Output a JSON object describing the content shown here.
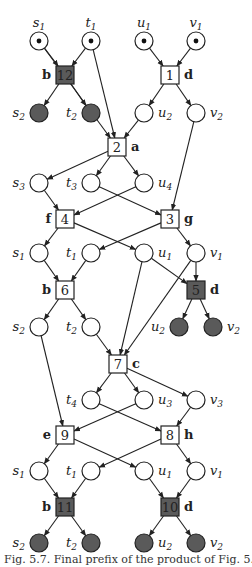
{
  "figure": {
    "caption": "Fig. 5.7. Final prefix of the product of Fig. 5.5",
    "colors": {
      "filled": "#5a5a5a",
      "stroke": "#222222",
      "empty": "#ffffff"
    }
  },
  "places": [
    {
      "id": "p_s1a",
      "name": "s",
      "sub": "1",
      "x": 39,
      "y": 41,
      "marked": true,
      "side": "top"
    },
    {
      "id": "p_t1a",
      "name": "t",
      "sub": "1",
      "x": 91,
      "y": 41,
      "marked": true,
      "side": "top"
    },
    {
      "id": "p_u1a",
      "name": "u",
      "sub": "1",
      "x": 144,
      "y": 41,
      "marked": true,
      "side": "top"
    },
    {
      "id": "p_v1a",
      "name": "v",
      "sub": "1",
      "x": 196,
      "y": 41,
      "marked": true,
      "side": "top"
    },
    {
      "id": "p_s2a",
      "name": "s",
      "sub": "2",
      "x": 39,
      "y": 113,
      "filled": true,
      "side": "left"
    },
    {
      "id": "p_t2a",
      "name": "t",
      "sub": "2",
      "x": 91,
      "y": 113,
      "filled": true,
      "side": "left"
    },
    {
      "id": "p_u2a",
      "name": "u",
      "sub": "2",
      "x": 144,
      "y": 113,
      "side": "right"
    },
    {
      "id": "p_v2a",
      "name": "v",
      "sub": "2",
      "x": 196,
      "y": 113,
      "side": "right"
    },
    {
      "id": "p_s3",
      "name": "s",
      "sub": "3",
      "x": 39,
      "y": 183,
      "side": "left"
    },
    {
      "id": "p_t3",
      "name": "t",
      "sub": "3",
      "x": 91,
      "y": 183,
      "side": "left"
    },
    {
      "id": "p_u4",
      "name": "u",
      "sub": "4",
      "x": 144,
      "y": 183,
      "side": "right"
    },
    {
      "id": "p_s1b",
      "name": "s",
      "sub": "1",
      "x": 39,
      "y": 253,
      "side": "left"
    },
    {
      "id": "p_t1b",
      "name": "t",
      "sub": "1",
      "x": 91,
      "y": 253,
      "side": "left"
    },
    {
      "id": "p_u1b",
      "name": "u",
      "sub": "1",
      "x": 144,
      "y": 253,
      "side": "right"
    },
    {
      "id": "p_v1b",
      "name": "v",
      "sub": "1",
      "x": 196,
      "y": 253,
      "side": "right"
    },
    {
      "id": "p_s2b",
      "name": "s",
      "sub": "2",
      "x": 39,
      "y": 327,
      "side": "left"
    },
    {
      "id": "p_t2b",
      "name": "t",
      "sub": "2",
      "x": 91,
      "y": 327,
      "side": "left"
    },
    {
      "id": "p_u2b",
      "name": "u",
      "sub": "2",
      "x": 179,
      "y": 327,
      "filled": true,
      "side": "left"
    },
    {
      "id": "p_v2b",
      "name": "v",
      "sub": "2",
      "x": 213,
      "y": 327,
      "filled": true,
      "side": "right"
    },
    {
      "id": "p_t4",
      "name": "t",
      "sub": "4",
      "x": 91,
      "y": 400,
      "side": "left"
    },
    {
      "id": "p_u3",
      "name": "u",
      "sub": "3",
      "x": 144,
      "y": 400,
      "side": "right"
    },
    {
      "id": "p_v3",
      "name": "v",
      "sub": "3",
      "x": 196,
      "y": 400,
      "side": "right"
    },
    {
      "id": "p_s1c",
      "name": "s",
      "sub": "1",
      "x": 39,
      "y": 471,
      "side": "left"
    },
    {
      "id": "p_t1c",
      "name": "t",
      "sub": "1",
      "x": 91,
      "y": 471,
      "side": "left"
    },
    {
      "id": "p_u1c",
      "name": "u",
      "sub": "1",
      "x": 144,
      "y": 471,
      "side": "right"
    },
    {
      "id": "p_v1c",
      "name": "v",
      "sub": "1",
      "x": 196,
      "y": 471,
      "side": "right"
    },
    {
      "id": "p_s2c",
      "name": "s",
      "sub": "2",
      "x": 39,
      "y": 543,
      "filled": true,
      "side": "left"
    },
    {
      "id": "p_t2c",
      "name": "t",
      "sub": "2",
      "x": 91,
      "y": 543,
      "filled": true,
      "side": "left"
    },
    {
      "id": "p_u2c",
      "name": "u",
      "sub": "2",
      "x": 144,
      "y": 543,
      "filled": true,
      "side": "right"
    },
    {
      "id": "p_v2c",
      "name": "v",
      "sub": "2",
      "x": 196,
      "y": 543,
      "filled": true,
      "side": "right"
    }
  ],
  "transitions": [
    {
      "id": "T12",
      "num": "12",
      "label": "b",
      "x": 65,
      "y": 75,
      "filled": true,
      "side": "left"
    },
    {
      "id": "T1",
      "num": "1",
      "label": "d",
      "x": 170,
      "y": 75,
      "side": "right"
    },
    {
      "id": "T2",
      "num": "2",
      "label": "a",
      "x": 117,
      "y": 147,
      "side": "right"
    },
    {
      "id": "T4",
      "num": "4",
      "label": "f",
      "x": 65,
      "y": 219,
      "side": "left"
    },
    {
      "id": "T3",
      "num": "3",
      "label": "g",
      "x": 170,
      "y": 219,
      "side": "right"
    },
    {
      "id": "T6",
      "num": "6",
      "label": "b",
      "x": 65,
      "y": 290,
      "side": "left"
    },
    {
      "id": "T5",
      "num": "5",
      "label": "d",
      "x": 196,
      "y": 290,
      "filled": true,
      "side": "right"
    },
    {
      "id": "T7",
      "num": "7",
      "label": "c",
      "x": 118,
      "y": 364,
      "side": "right"
    },
    {
      "id": "T9",
      "num": "9",
      "label": "e",
      "x": 65,
      "y": 435,
      "side": "left"
    },
    {
      "id": "T8",
      "num": "8",
      "label": "h",
      "x": 170,
      "y": 435,
      "side": "right"
    },
    {
      "id": "T11",
      "num": "11",
      "label": "b",
      "x": 65,
      "y": 507,
      "filled": true,
      "side": "left"
    },
    {
      "id": "T10",
      "num": "10",
      "label": "d",
      "x": 170,
      "y": 507,
      "filled": true,
      "side": "right"
    }
  ],
  "arcs": [
    [
      "p_s1a",
      "T12"
    ],
    [
      "p_t1a",
      "T12"
    ],
    [
      "p_u1a",
      "T1"
    ],
    [
      "p_v1a",
      "T1"
    ],
    [
      "T12",
      "p_s2a"
    ],
    [
      "T12",
      "p_t2a"
    ],
    [
      "T1",
      "p_u2a"
    ],
    [
      "T1",
      "p_v2a"
    ],
    [
      "p_s1a",
      "T2"
    ],
    [
      "p_t1a",
      "T2"
    ],
    [
      "p_u2a",
      "T2"
    ],
    [
      "T2",
      "p_s3"
    ],
    [
      "T2",
      "p_t3"
    ],
    [
      "T2",
      "p_u4"
    ],
    [
      "p_s3",
      "T4"
    ],
    [
      "p_u4",
      "T4"
    ],
    [
      "p_t3",
      "T3"
    ],
    [
      "p_v2a",
      "T3"
    ],
    [
      "T4",
      "p_s1b"
    ],
    [
      "T4",
      "p_u1b"
    ],
    [
      "T3",
      "p_t1b"
    ],
    [
      "T3",
      "p_v1b"
    ],
    [
      "p_s1b",
      "T6"
    ],
    [
      "p_t1b",
      "T6"
    ],
    [
      "p_u1b",
      "T5"
    ],
    [
      "p_v1b",
      "T5"
    ],
    [
      "T6",
      "p_s2b"
    ],
    [
      "T6",
      "p_t2b"
    ],
    [
      "T5",
      "p_u2b"
    ],
    [
      "T5",
      "p_v2b"
    ],
    [
      "p_t2b",
      "T7"
    ],
    [
      "p_u1b",
      "T7"
    ],
    [
      "p_v1b",
      "T7"
    ],
    [
      "T7",
      "p_t4"
    ],
    [
      "T7",
      "p_u3"
    ],
    [
      "T7",
      "p_v3"
    ],
    [
      "p_s2b",
      "T9"
    ],
    [
      "p_u3",
      "T9"
    ],
    [
      "p_t4",
      "T8"
    ],
    [
      "p_v3",
      "T8"
    ],
    [
      "T9",
      "p_s1c"
    ],
    [
      "T9",
      "p_u1c"
    ],
    [
      "T8",
      "p_t1c"
    ],
    [
      "T8",
      "p_v1c"
    ],
    [
      "p_s1c",
      "T11"
    ],
    [
      "p_t1c",
      "T11"
    ],
    [
      "p_u1c",
      "T10"
    ],
    [
      "p_v1c",
      "T10"
    ],
    [
      "T11",
      "p_s2c"
    ],
    [
      "T11",
      "p_t2c"
    ],
    [
      "T10",
      "p_u2c"
    ],
    [
      "T10",
      "p_v2c"
    ]
  ]
}
